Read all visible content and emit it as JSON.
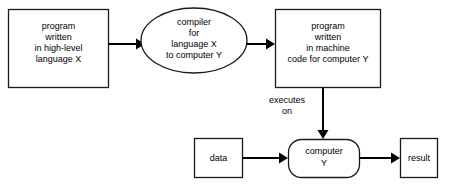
{
  "diagram": {
    "background_color": "#ffffff",
    "stroke_color": "#1a1a1a",
    "text_color": "#000000",
    "nodes": [
      {
        "id": "source-program",
        "shape": "rectangle",
        "lines": [
          "program",
          "written",
          "in high-level",
          "language X"
        ]
      },
      {
        "id": "compiler",
        "shape": "ellipse",
        "lines": [
          "compiler",
          "for",
          "language X",
          "to computer Y"
        ]
      },
      {
        "id": "machine-program",
        "shape": "rectangle",
        "lines": [
          "program",
          "written",
          "in machine",
          "code for computer Y"
        ]
      },
      {
        "id": "data",
        "shape": "rectangle",
        "lines": [
          "data"
        ]
      },
      {
        "id": "computer",
        "shape": "rounded-rectangle",
        "lines": [
          "computer",
          "Y"
        ]
      },
      {
        "id": "result",
        "shape": "rectangle",
        "lines": [
          "result"
        ]
      }
    ],
    "edges": [
      {
        "id": "source-to-compiler",
        "from": "source-program",
        "to": "compiler",
        "label": ""
      },
      {
        "id": "compiler-to-machine",
        "from": "compiler",
        "to": "machine-program",
        "label": ""
      },
      {
        "id": "machine-to-computer",
        "from": "machine-program",
        "to": "computer",
        "label_lines": [
          "executes",
          "on"
        ]
      },
      {
        "id": "data-to-computer",
        "from": "data",
        "to": "computer",
        "label": ""
      },
      {
        "id": "computer-to-result",
        "from": "computer",
        "to": "result",
        "label": ""
      }
    ]
  }
}
